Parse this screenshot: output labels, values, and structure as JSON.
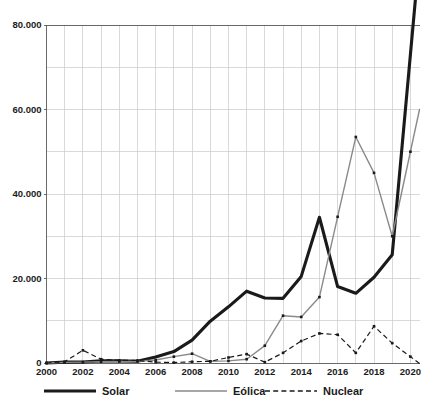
{
  "chart_data": {
    "type": "line",
    "title": "",
    "subtitle": "",
    "xlabel": "",
    "ylabel": "",
    "x": [
      2000,
      2001,
      2002,
      2003,
      2004,
      2005,
      2006,
      2007,
      2008,
      2009,
      2010,
      2011,
      2012,
      2013,
      2014,
      2015,
      2016,
      2017,
      2018,
      2019,
      2020
    ],
    "xlim": [
      2000,
      2020.5
    ],
    "ylim": [
      0,
      80000
    ],
    "grid": true,
    "legend_position": "bottom",
    "y_tick_values": [
      0,
      20000,
      40000,
      60000,
      80000
    ],
    "y_tick_labels": [
      "0",
      "20.000",
      "40.000",
      "60.000",
      "80.000"
    ],
    "y_minor_tick_values": [
      10000,
      30000,
      50000,
      70000
    ],
    "x_tick_values": [
      2000,
      2002,
      2004,
      2006,
      2008,
      2010,
      2012,
      2014,
      2016,
      2018,
      2020
    ],
    "x_tick_labels": [
      "2000",
      "2002",
      "2004",
      "2006",
      "2008",
      "2010",
      "2012",
      "2014",
      "2016",
      "2018",
      "2020"
    ],
    "series": [
      {
        "name": "Solar",
        "color": "#1a1a1a",
        "style": "solid-thick",
        "values": [
          0,
          200,
          250,
          500,
          500,
          400,
          1400,
          2700,
          5400,
          9900,
          13300,
          17000,
          15400,
          15300,
          20500,
          34500,
          18100,
          16500,
          20300,
          25600,
          73000
        ]
      },
      {
        "name": "Eólica",
        "color": "#8a8a8a",
        "style": "solid-thin",
        "values": [
          0,
          150,
          200,
          300,
          350,
          400,
          700,
          1500,
          2200,
          400,
          500,
          900,
          4100,
          11200,
          10900,
          15600,
          34600,
          53500,
          45000,
          30000,
          50000
        ]
      },
      {
        "name": "Nuclear",
        "color": "#1a1a1a",
        "style": "dashed",
        "values": [
          0,
          300,
          3000,
          900,
          600,
          600,
          200,
          100,
          300,
          400,
          1300,
          2100,
          200,
          2400,
          5200,
          7000,
          6700,
          2400,
          8700,
          4700,
          1500
        ]
      }
    ],
    "series_end_extension": {
      "enabled": true,
      "note": "lines extend slightly past 2020 to the plot right edge"
    }
  },
  "legend": {
    "items": [
      {
        "label": "Solar",
        "swatch": "solid-thick-black-line-icon"
      },
      {
        "label": "Eólica",
        "swatch": "solid-thin-gray-line-icon"
      },
      {
        "label": "Nuclear",
        "swatch": "dashed-black-line-icon"
      }
    ]
  },
  "colors": {
    "solar": "#1a1a1a",
    "eolica": "#8a8a8a",
    "nuclear": "#1a1a1a",
    "grid": "#c9c9c9",
    "axis": "#5a5a5a",
    "text": "#1b1b1b",
    "background": "#ffffff"
  }
}
